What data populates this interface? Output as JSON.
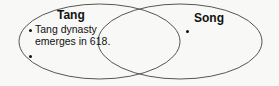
{
  "diagram": {
    "type": "venn",
    "circles": [
      {
        "id": "left",
        "title": "Tang",
        "items": [
          "Tang dynasty emerges in 618.",
          ""
        ]
      },
      {
        "id": "right",
        "title": "Song",
        "items": [
          ""
        ]
      }
    ],
    "left": {
      "title": "Tang",
      "item1_line1": "Tang dynasty",
      "item1_line2": "emerges in 618."
    },
    "right": {
      "title": "Song"
    },
    "colors": {
      "stroke": "#555555",
      "background": "#f8f8f6",
      "text": "#111111"
    }
  }
}
